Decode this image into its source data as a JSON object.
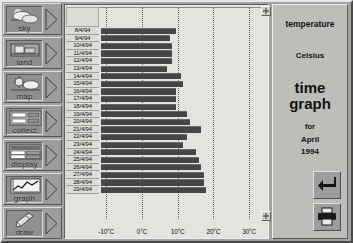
{
  "app": {
    "title": "time graph",
    "accent_bar": "#464646",
    "panel_bg": "#bdbdba"
  },
  "toolbar": {
    "items": [
      {
        "label": "sky",
        "icon": "cloud-sun-icon"
      },
      {
        "label": "land",
        "icon": "landscape-icon"
      },
      {
        "label": "map",
        "icon": "sun-cloud-map-icon"
      },
      {
        "label": "collect",
        "icon": "data-form-icon"
      },
      {
        "label": "display",
        "icon": "table-display-icon"
      },
      {
        "label": "graph",
        "icon": "line-graph-icon"
      },
      {
        "label": "draw",
        "icon": "paintbrush-icon"
      }
    ],
    "arrow_icon": "triangle-right-icon"
  },
  "info": {
    "measurement": "temperature",
    "unit": "Celsius",
    "title_line1": "time",
    "title_line2": "graph",
    "for_label": "for",
    "month": "April",
    "year": "1994",
    "enter_button": "enter-arrow-icon",
    "print_button": "printer-icon"
  },
  "handles": {
    "top_right": "resize-handle-icon",
    "bottom_right": "resize-handle-icon"
  },
  "chart_data": {
    "type": "bar",
    "orientation": "horizontal",
    "xlabel": "",
    "ylabel": "",
    "unit": "°C",
    "xlim": [
      -12,
      35
    ],
    "grid": true,
    "xticks": [
      -10,
      0,
      10,
      20,
      30
    ],
    "xtick_labels": [
      "-10°C",
      "0°C",
      "10°C",
      "20°C",
      "30°C"
    ],
    "categories": [
      "8/4/94",
      "9/4/94",
      "10/4/94",
      "11/4/94",
      "12/4/94",
      "13/4/94",
      "14/4/94",
      "15/4/94",
      "16/4/94",
      "17/4/94",
      "18/4/94",
      "19/4/94",
      "20/4/94",
      "21/4/94",
      "22/4/94",
      "23/4/94",
      "24/4/94",
      "25/4/94",
      "26/4/94",
      "27/4/94",
      "28/4/94",
      "29/4/94"
    ],
    "values": [
      9.5,
      8.0,
      8.5,
      8.5,
      8.5,
      7.0,
      11.0,
      11.5,
      9.5,
      9.5,
      9.5,
      12.5,
      13.5,
      16.5,
      12.5,
      11.5,
      15.0,
      16.0,
      16.5,
      17.5,
      17.5,
      18.0
    ],
    "baseline": -11.5,
    "bar_color": "#464646"
  }
}
